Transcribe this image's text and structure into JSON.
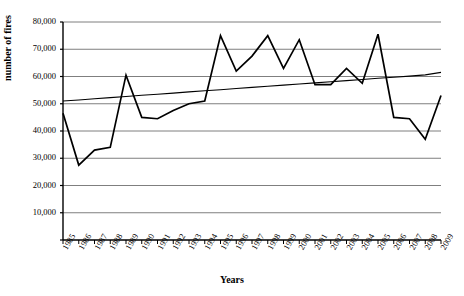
{
  "chart_data": {
    "type": "line",
    "title": "",
    "xlabel": "Years",
    "ylabel": "number of fires",
    "xlim": [
      1985,
      2009
    ],
    "ylim": [
      0,
      80000
    ],
    "grid": true,
    "legend": "none",
    "x": [
      1985,
      1986,
      1987,
      1988,
      1989,
      1990,
      1991,
      1992,
      1993,
      1994,
      1995,
      1996,
      1997,
      1998,
      1999,
      2000,
      2001,
      2002,
      2003,
      2004,
      2005,
      2006,
      2007,
      2008,
      2009
    ],
    "categories": [
      "1985",
      "1986",
      "1987",
      "1988",
      "1989",
      "1990",
      "1991",
      "1992",
      "1993",
      "1994",
      "1995",
      "1996",
      "1997",
      "1998",
      "1999",
      "2000",
      "2001",
      "2002",
      "2003",
      "2004",
      "2005",
      "2006",
      "2007",
      "2008",
      "2009"
    ],
    "series": [
      {
        "name": "number of fires",
        "values": [
          46500,
          27500,
          33000,
          34000,
          60500,
          45000,
          44500,
          47500,
          50000,
          51000,
          75000,
          62000,
          67500,
          75000,
          63000,
          73500,
          57000,
          57000,
          63000,
          57500,
          75500,
          45000,
          44500,
          37000,
          53000
        ]
      },
      {
        "name": "linear trend",
        "type": "trendline",
        "values": [
          51000,
          51400,
          51850,
          52250,
          52650,
          53100,
          53500,
          53900,
          54350,
          54750,
          55150,
          55600,
          56000,
          56400,
          56850,
          57250,
          57650,
          58100,
          58500,
          58900,
          59350,
          59750,
          60150,
          60600,
          61500
        ]
      }
    ],
    "y_ticks": [
      0,
      10000,
      20000,
      30000,
      40000,
      50000,
      60000,
      70000,
      80000
    ],
    "y_tick_labels": [
      "",
      "10,000",
      "20,000",
      "30,000",
      "40,000",
      "50,000",
      "60,000",
      "70,000",
      "80,000"
    ],
    "colors": {
      "series_line": "#000000",
      "trend_line": "#000000",
      "gridline": "#7f7f7f",
      "axis": "#000000",
      "background": "#ffffff"
    }
  }
}
